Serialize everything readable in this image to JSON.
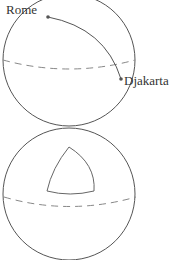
{
  "figure": {
    "top_sphere": {
      "labels": {
        "city_a": "Rome",
        "city_b": "Djakarta"
      },
      "description": "Great-circle path between two cities on a sphere"
    },
    "bottom_sphere": {
      "description": "Spherical triangle on a sphere"
    },
    "colors": {
      "stroke": "#555555",
      "equator": "#888888",
      "point": "#555555",
      "text": "#333333"
    }
  }
}
